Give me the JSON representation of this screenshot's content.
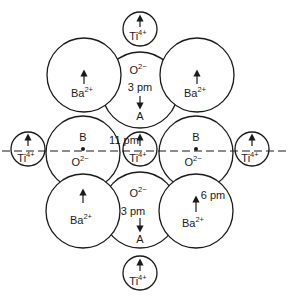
{
  "diagram": {
    "title": "",
    "ions": {
      "ba": {
        "symbol": "Ba",
        "charge": "2+"
      },
      "ti": {
        "symbol": "Ti",
        "charge": "4+"
      },
      "o": {
        "symbol": "O",
        "charge": "2−"
      }
    },
    "site_labels": {
      "a": "A",
      "b": "B"
    },
    "displacements": {
      "o_a_site": "3 pm",
      "ti_center": "11 pm",
      "ba": "6 pm"
    },
    "arrow_directions": {
      "ba": "up",
      "ti": "up",
      "o_a_site": "down"
    },
    "axis": "dashed horizontal line through Ti⁴⁺ and O²⁻ (B) centers"
  }
}
